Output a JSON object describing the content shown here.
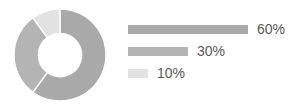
{
  "chart_data": {
    "type": "pie",
    "variant": "donut",
    "title": "",
    "subtitle": "",
    "xlabel": "",
    "ylabel": "",
    "grid": false,
    "legend_position": "right",
    "legend_style": "proportional-bars",
    "labels": [
      "60%",
      "30%",
      "10%"
    ],
    "values": [
      60,
      30,
      10
    ],
    "value_labels": [
      "60%",
      "30%",
      "10%"
    ],
    "colors": [
      "#a9a9a9",
      "#b4b4b4",
      "#e2e2e2"
    ],
    "start_angle_deg": 0,
    "direction": "clockwise",
    "inner_radius_ratio": 0.47,
    "slice_separator_color": "#ffffff",
    "background": "#ffffff",
    "text_color": "#595959"
  },
  "donut": {
    "center_x": 48,
    "center_y": 48,
    "outer_radius": 46,
    "inner_radius": 21.6,
    "slices": [
      {
        "name": "slice-60",
        "value": 60,
        "color": "#a9a9a9",
        "start_deg": 0,
        "end_deg": 216
      },
      {
        "name": "slice-30",
        "value": 30,
        "color": "#b4b4b4",
        "start_deg": 216,
        "end_deg": 324
      },
      {
        "name": "slice-10",
        "value": 10,
        "color": "#e2e2e2",
        "start_deg": 324,
        "end_deg": 360
      }
    ]
  },
  "legend": {
    "bar_max_width": 120,
    "bar_height": 9,
    "items": [
      {
        "label": "60%",
        "value": 60,
        "color": "#a9a9a9",
        "bar_width": 120
      },
      {
        "label": "30%",
        "value": 30,
        "color": "#b4b4b4",
        "bar_width": 60
      },
      {
        "label": "10%",
        "value": 10,
        "color": "#e2e2e2",
        "bar_width": 20
      }
    ]
  }
}
